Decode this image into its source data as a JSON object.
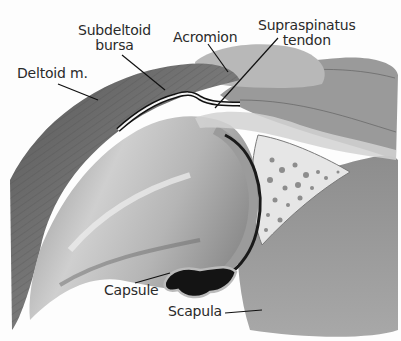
{
  "figure": {
    "labels": {
      "subdeltoid_bursa_line1": "Subdeltoid",
      "subdeltoid_bursa_line2": "bursa",
      "acromion": "Acromion",
      "supraspinatus_line1": "Supraspinatus",
      "supraspinatus_line2": "tendon",
      "deltoid": "Deltoid m.",
      "capsule": "Capsule",
      "scapula": "Scapula"
    },
    "colors": {
      "background": "#fdfdfd",
      "muscle": "#6e6e6e",
      "muscle_dark": "#4a4a4a",
      "bone_light": "#d8d8d8",
      "bone_mid": "#a9a9a9",
      "cartilage": "#8a8a8a",
      "joint_space": "#1a1a1a",
      "scapula": "#9a9a9a",
      "text": "#2a2a2a"
    }
  }
}
